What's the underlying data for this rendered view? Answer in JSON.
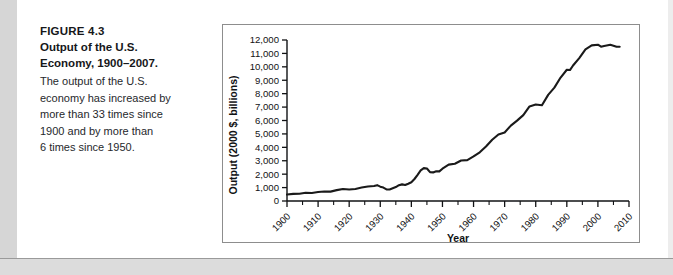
{
  "caption": {
    "figure_label": "FIGURE 4.3",
    "title_line1": "Output of the U.S.",
    "title_line2": "Economy, 1900–2007.",
    "body_line1": "The output of the U.S.",
    "body_line2": "economy has increased by",
    "body_line3": "more than 33 times since",
    "body_line4": "1900 and by more than",
    "body_line5": "6 times since 1950."
  },
  "colors": {
    "line": "#1a1a1a",
    "axis": "#111214",
    "frame": "#8d8d8d",
    "page_edge": "#d6d6d6"
  },
  "chart_data": {
    "type": "line",
    "title": "",
    "xlabel": "Year",
    "ylabel": "Output (2000 $, billions)",
    "xlim": [
      1900,
      2010
    ],
    "ylim": [
      0,
      12000
    ],
    "ytick_labels": [
      "0",
      "1,000",
      "2,000",
      "3,000",
      "4,000",
      "5,000",
      "6,000",
      "7,000",
      "8,000",
      "9,000",
      "10,000",
      "11,000",
      "12,000"
    ],
    "yticks": [
      0,
      1000,
      2000,
      3000,
      4000,
      5000,
      6000,
      7000,
      8000,
      9000,
      10000,
      11000,
      12000
    ],
    "xtick_labels": [
      "1900",
      "1910",
      "1920",
      "1930",
      "1940",
      "1950",
      "1960",
      "1970",
      "1980",
      "1990",
      "2000",
      "2010"
    ],
    "xticks": [
      1900,
      1910,
      1920,
      1930,
      1940,
      1950,
      1960,
      1970,
      1980,
      1990,
      2000,
      2010
    ],
    "xtick_rotation": 45,
    "grid": false,
    "legend": false,
    "series": [
      {
        "name": "U.S. real output",
        "x": [
          1900,
          1902,
          1904,
          1906,
          1908,
          1910,
          1912,
          1914,
          1916,
          1918,
          1920,
          1922,
          1924,
          1926,
          1928,
          1929,
          1930,
          1931,
          1932,
          1933,
          1934,
          1935,
          1936,
          1937,
          1938,
          1939,
          1940,
          1941,
          1942,
          1943,
          1944,
          1945,
          1946,
          1947,
          1948,
          1949,
          1950,
          1952,
          1954,
          1956,
          1958,
          1960,
          1962,
          1964,
          1966,
          1968,
          1970,
          1972,
          1974,
          1976,
          1978,
          1980,
          1982,
          1984,
          1986,
          1988,
          1990,
          1991,
          1992,
          1994,
          1996,
          1998,
          2000,
          2001,
          2002,
          2004,
          2006,
          2007
        ],
        "values": [
          480,
          530,
          545,
          620,
          600,
          670,
          710,
          700,
          810,
          900,
          860,
          900,
          1000,
          1100,
          1120,
          1180,
          1070,
          1000,
          870,
          860,
          950,
          1040,
          1180,
          1240,
          1190,
          1290,
          1400,
          1640,
          1950,
          2280,
          2450,
          2420,
          2150,
          2130,
          2220,
          2210,
          2410,
          2710,
          2780,
          3020,
          3050,
          3320,
          3630,
          4060,
          4560,
          4960,
          5110,
          5620,
          5990,
          6400,
          7050,
          7190,
          7140,
          7910,
          8450,
          9200,
          9780,
          9760,
          10100,
          10650,
          11300,
          12300,
          13200,
          13300,
          13500,
          14200,
          15100,
          15500
        ],
        "values_scaled_note": "plotted values",
        "plot_values": [
          480,
          530,
          545,
          620,
          600,
          670,
          710,
          700,
          810,
          900,
          860,
          900,
          1000,
          1080,
          1120,
          1180,
          1070,
          1000,
          870,
          860,
          950,
          1040,
          1180,
          1240,
          1190,
          1290,
          1400,
          1640,
          1950,
          2280,
          2450,
          2420,
          2150,
          2130,
          2220,
          2210,
          2410,
          2710,
          2780,
          3020,
          3050,
          3320,
          3630,
          4060,
          4560,
          4960,
          5110,
          5620,
          5990,
          6400,
          7050,
          7190,
          7140,
          7910,
          8450,
          9200,
          9780,
          9760,
          10100,
          10650,
          11300,
          11600,
          11650,
          11500,
          11550,
          11650,
          11500,
          11500
        ]
      }
    ]
  }
}
